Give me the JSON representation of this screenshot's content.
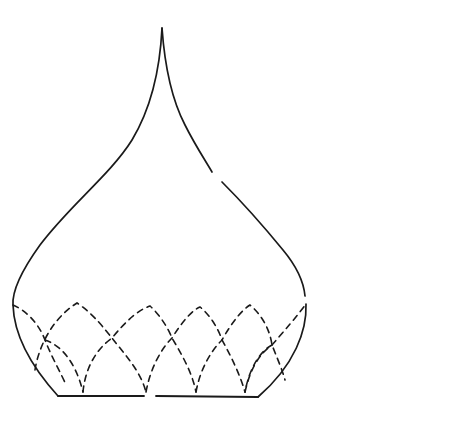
{
  "drawing": {
    "subject": "Onion dome line drawing",
    "colors": {
      "background": "#ffffff",
      "ink": "#1a1a1a"
    },
    "outline": {
      "tip": [
        162,
        28
      ],
      "left_extreme": [
        13,
        305
      ],
      "right_extreme": [
        306,
        302
      ],
      "base_left": [
        58,
        396
      ],
      "base_right": [
        258,
        397
      ]
    },
    "upper_arch_peaks": [
      [
        77,
        303
      ],
      [
        150,
        306
      ],
      [
        200,
        307
      ],
      [
        250,
        305
      ]
    ],
    "crossings": [
      [
        45,
        340
      ],
      [
        112,
        338
      ],
      [
        172,
        338
      ],
      [
        222,
        340
      ],
      [
        272,
        345
      ]
    ],
    "lower_arch_feet_x": [
      83,
      146,
      196,
      245
    ],
    "base_gap_x": 147
  }
}
